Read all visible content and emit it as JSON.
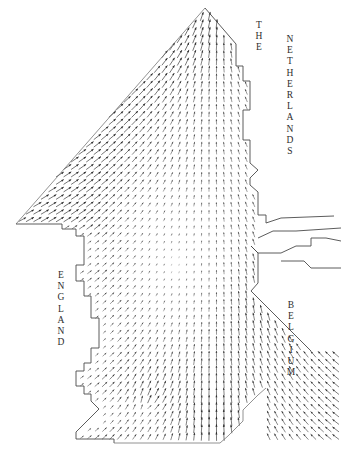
{
  "figure": {
    "type": "vector-field-map",
    "width": 341,
    "height": 454,
    "background_color": "#ffffff",
    "coast_color": "#4a4a4a",
    "arrow_color": "#2b2b2b"
  },
  "labels": {
    "netherlands_the": "T\nH\nE",
    "netherlands": "N\nE\nT\nH\nE\nR\nL\nA\nN\nD\nS",
    "england": "E\nN\nG\nL\nA\nN\nD",
    "belgium": "B\nE\nL\nG\nI\nU\nM"
  },
  "chart_data": {
    "type": "scatter",
    "xlabel": "",
    "ylabel": "",
    "grid": false,
    "legend": null,
    "annotations": [
      "THE NETHERLANDS",
      "ENGLAND",
      "BELGIUM"
    ],
    "grid_spacing_px": 7.5,
    "arrow_scale": 1.0,
    "coastlines": {
      "england_east": [
        [
          16,
          224
        ],
        [
          62,
          224
        ],
        [
          62,
          229
        ],
        [
          76,
          229
        ],
        [
          76,
          236
        ],
        [
          84,
          236
        ],
        [
          84,
          265
        ],
        [
          76,
          265
        ],
        [
          76,
          281
        ],
        [
          84,
          281
        ],
        [
          84,
          296
        ],
        [
          91,
          296
        ],
        [
          91,
          318
        ],
        [
          99,
          318
        ],
        [
          99,
          348
        ],
        [
          91,
          348
        ],
        [
          91,
          363
        ],
        [
          84,
          363
        ],
        [
          84,
          371
        ],
        [
          76,
          371
        ],
        [
          76,
          386
        ],
        [
          84,
          386
        ],
        [
          84,
          394
        ],
        [
          91,
          394
        ],
        [
          91,
          401
        ],
        [
          99,
          409
        ],
        [
          84,
          424
        ],
        [
          76,
          432
        ],
        [
          76,
          439
        ],
        [
          114,
          439
        ],
        [
          114,
          443
        ]
      ],
      "open_boundary_nw": [
        [
          16,
          224
        ],
        [
          205,
          8
        ]
      ],
      "netherlands_coast": [
        [
          205,
          8
        ],
        [
          236,
          44
        ],
        [
          236,
          66
        ],
        [
          243,
          66
        ],
        [
          243,
          81
        ],
        [
          250,
          81
        ],
        [
          250,
          110
        ],
        [
          243,
          110
        ],
        [
          243,
          140
        ],
        [
          250,
          140
        ],
        [
          250,
          163
        ],
        [
          258,
          170
        ],
        [
          250,
          178
        ],
        [
          250,
          185
        ],
        [
          258,
          192
        ],
        [
          258,
          215
        ],
        [
          266,
          215
        ],
        [
          266,
          223
        ]
      ],
      "estuary_islands": [
        [
          [
            266,
            223
          ],
          [
            281,
            218
          ],
          [
            334,
            216
          ]
        ],
        [
          [
            258,
            238
          ],
          [
            273,
            231
          ],
          [
            296,
            231
          ],
          [
            341,
            228
          ]
        ],
        [
          [
            251,
            246
          ],
          [
            258,
            253
          ],
          [
            281,
            253
          ],
          [
            296,
            246
          ],
          [
            311,
            246
          ],
          [
            311,
            238
          ],
          [
            326,
            238
          ],
          [
            341,
            241
          ]
        ],
        [
          [
            281,
            261
          ],
          [
            304,
            261
          ],
          [
            311,
            268
          ],
          [
            341,
            268
          ]
        ]
      ],
      "belgium_coast": [
        [
          251,
          246
        ],
        [
          258,
          253
        ],
        [
          258,
          283
        ],
        [
          251,
          291
        ],
        [
          266,
          306
        ],
        [
          281,
          321
        ],
        [
          296,
          336
        ],
        [
          311,
          351
        ]
      ],
      "south_boundary": [
        [
          114,
          443
        ],
        [
          205,
          443
        ],
        [
          220,
          443
        ],
        [
          228,
          436
        ],
        [
          236,
          428
        ],
        [
          243,
          421
        ],
        [
          243,
          410
        ],
        [
          251,
          402
        ],
        [
          258,
          395
        ],
        [
          266,
          388
        ]
      ]
    },
    "vectors_note": "Each grid point carries a vector whose length encodes current speed and orientation encodes current direction; reproduced procedurally from the flow pattern visible in the figure.",
    "flow_pattern": {
      "apex_north": {
        "x": 205,
        "y": 8,
        "direction_deg": 90,
        "magnitude": "max"
      },
      "northwest_boundary": {
        "direction_deg": 60,
        "magnitude": "high"
      },
      "central_basin": {
        "direction_deg": 90,
        "magnitude": "low"
      },
      "belgian_coast": {
        "direction_deg": 70,
        "magnitude": "high"
      },
      "dover_strait": {
        "direction_deg": 80,
        "magnitude": "high"
      },
      "headland_convergence": {
        "x": 148,
        "y": 404
      }
    }
  }
}
